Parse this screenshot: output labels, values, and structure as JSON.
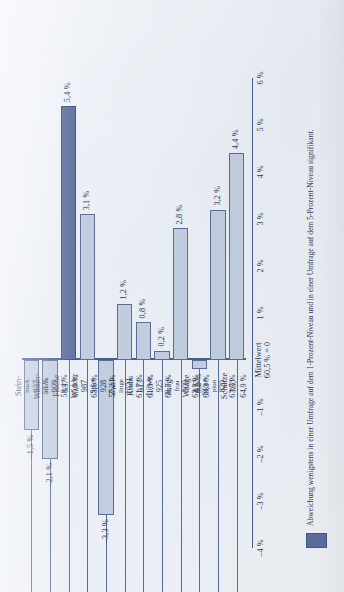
{
  "chart_data": {
    "type": "bar",
    "title": "",
    "xlabel": "",
    "ylabel": "",
    "orientation": "vertical",
    "baseline_label": "Mittelwert 60,5 % = 0",
    "baseline_line1": "Mittelwert",
    "baseline_line2": "60,5 % = 0",
    "ylim": [
      -4,
      6
    ],
    "yticks": [
      "6 %",
      "5 %",
      "4 %",
      "3 %",
      "2 %",
      "1 %",
      "–1 %",
      "–2 %",
      "–3 %",
      "–4 %"
    ],
    "ytick_values": [
      6,
      5,
      4,
      3,
      2,
      1,
      -1,
      -2,
      -3,
      -4
    ],
    "grid": false,
    "categories": [
      "Stein-bock",
      "Wasser-mann",
      "Fische",
      "Widder",
      "Stier",
      "Zwil-linge",
      "Krebs",
      "Löwe",
      "Jung-frau",
      "Waage",
      "Skor-pion",
      "Schütze"
    ],
    "values": [
      -1.5,
      -2.1,
      5.4,
      3.1,
      -3.3,
      1.2,
      0.8,
      0.2,
      2.8,
      -0.2,
      3.2,
      4.4
    ],
    "value_labels": [
      "–1,5 %",
      "–2,1 %",
      "5,4 %",
      "3,1 %",
      "–3,3 %",
      "1,2 %",
      "0,8 %",
      "0,2 %",
      "2,8 %",
      "–0,2 %",
      "3,2 %",
      "4,4 %"
    ],
    "series": [
      {
        "name": "Abweichung vom Mittelwert",
        "values": [
          -1.5,
          -2.1,
          5.4,
          3.1,
          -3.3,
          1.2,
          0.8,
          0.2,
          2.8,
          -0.2,
          3.2,
          4.4
        ]
      }
    ],
    "table_headers": [
      "Sternzeichen",
      "n",
      "Anteil"
    ],
    "rows": [
      {
        "name_line1": "Stein-",
        "name_line2": "bock",
        "n": "837",
        "pct": "59 %",
        "value": -1.5,
        "label": "–1,5 %",
        "highlight": false
      },
      {
        "name_line1": "Wasser-",
        "name_line2": "mann",
        "n": "909",
        "pct": "58,4 %",
        "value": -2.1,
        "label": "–2,1 %",
        "highlight": false
      },
      {
        "name_line1": "Fische",
        "name_line2": "",
        "n": "937",
        "pct": "65,9 %",
        "value": 5.4,
        "label": "5,4 %",
        "highlight": true
      },
      {
        "name_line1": "Widder",
        "name_line2": "",
        "n": "987",
        "pct": "63,6 %",
        "value": 3.1,
        "label": "3,1 %",
        "highlight": false
      },
      {
        "name_line1": "Stier",
        "name_line2": "",
        "n": "928",
        "pct": "57,2 %",
        "value": -3.3,
        "label": "–3,3 %",
        "highlight": false
      },
      {
        "name_line1": "Zwil-",
        "name_line2": "linge",
        "n": "1021",
        "pct": "61,7 %",
        "value": 1.2,
        "label": "1,2 %",
        "highlight": false
      },
      {
        "name_line1": "Krebs",
        "name_line2": "",
        "n": "913",
        "pct": "61,3 %",
        "value": 0.8,
        "label": "0,8 %",
        "highlight": false
      },
      {
        "name_line1": "Löwe",
        "name_line2": "",
        "n": "925",
        "pct": "60,7 %",
        "value": 0.2,
        "label": "0,2 %",
        "highlight": false
      },
      {
        "name_line1": "Jung-",
        "name_line2": "frau",
        "n": "909",
        "pct": "63,3 %",
        "value": 2.8,
        "label": "2,8 %",
        "highlight": false
      },
      {
        "name_line1": "Waage",
        "name_line2": "",
        "n": "812",
        "pct": "60,3 %",
        "value": -0.2,
        "label": "–0,2 %",
        "highlight": false
      },
      {
        "name_line1": "Skor-",
        "name_line2": "pion",
        "n": "820",
        "pct": "63,7 %",
        "value": 3.2,
        "label": "3,2 %",
        "highlight": false
      },
      {
        "name_line1": "Schütze",
        "name_line2": "",
        "n": "760",
        "pct": "64,9 %",
        "value": 4.4,
        "label": "4,4 %",
        "highlight": false
      }
    ],
    "legend": {
      "position": "bottom-left",
      "swatch_color": "#5d6d9e",
      "text": "Abweichung wenigstens in einer Umfrage auf dem 1-Prozent-Niveau und in einer Umfrage auf dem 5-Prozent-Niveau signifikant."
    },
    "colors": {
      "bar_fill": "#c3cde0",
      "bar_stroke": "#5b6d97",
      "bar_highlight": "#5d6d9e",
      "axis": "#4a5d8c",
      "text": "#2c3a5c",
      "paper": "#eef2f7"
    }
  }
}
